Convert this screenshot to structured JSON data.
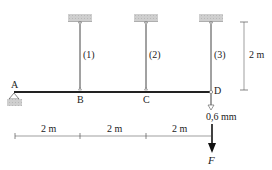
{
  "diagram": {
    "points": {
      "A": "A",
      "B": "B",
      "C": "C",
      "D": "D"
    },
    "bars": [
      {
        "label": "(1)"
      },
      {
        "label": "(2)"
      },
      {
        "label": "(3)"
      }
    ],
    "dimensions": {
      "vertical": "2 m",
      "horizontal": [
        "2 m",
        "2 m",
        "2 m"
      ]
    },
    "displacement": "0,6 mm",
    "force": "F",
    "colors": {
      "line": "#222222",
      "support": "#c8c8c8",
      "dimension": "#555555"
    }
  }
}
